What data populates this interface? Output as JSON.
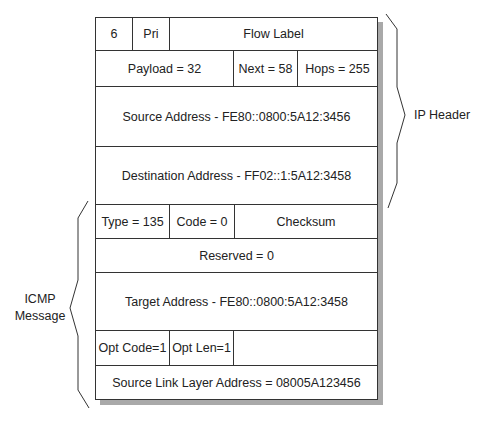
{
  "rows": [
    {
      "cells": [
        "6",
        "Pri",
        "Flow Label"
      ]
    },
    {
      "cells": [
        "Payload = 32",
        "Next = 58",
        "Hops = 255"
      ]
    },
    {
      "cells": [
        "Source Address - FE80::0800:5A12:3456"
      ]
    },
    {
      "cells": [
        "Destination Address - FF02::1:5A12:3458"
      ]
    },
    {
      "cells": [
        "Type = 135",
        "Code = 0",
        "Checksum"
      ]
    },
    {
      "cells": [
        "Reserved = 0"
      ]
    },
    {
      "cells": [
        "Target Address - FE80::0800:5A12:3458"
      ]
    },
    {
      "cells": [
        "Opt Code=1",
        "Opt Len=1",
        ""
      ]
    },
    {
      "cells": [
        "Source Link Layer Address = 08005A123456"
      ]
    }
  ],
  "labels": {
    "ip_header": "IP Header",
    "icmp_line1": "ICMP",
    "icmp_line2": "Message"
  }
}
